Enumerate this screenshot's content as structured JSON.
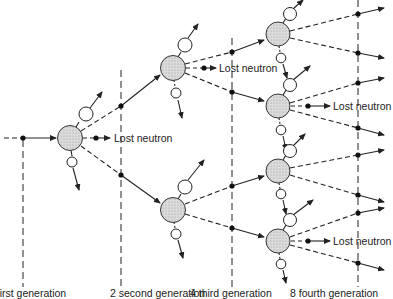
{
  "diagram": {
    "annotations": [
      {
        "id": "lost1",
        "text": "Lost neutron"
      },
      {
        "id": "lost2",
        "text": "Lost neutron"
      },
      {
        "id": "lost3",
        "text": "Lost neutron"
      },
      {
        "id": "lost4",
        "text": "Lost neutron"
      }
    ],
    "generations": [
      {
        "label": "1 first generation"
      },
      {
        "label": "2 second generation"
      },
      {
        "label": "4 third generation"
      },
      {
        "label": "8 fourth generation"
      }
    ],
    "colors": {
      "nucleus_fill": "#d4d4d4",
      "line": "#222222",
      "fragment_fill": "#ffffff"
    }
  }
}
